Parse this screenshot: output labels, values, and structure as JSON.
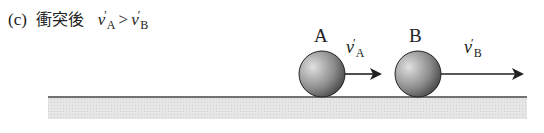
{
  "caption": {
    "label": "(c)",
    "japanese": "衝突後",
    "lhs_var": "v",
    "lhs_prime": "′",
    "lhs_sub": "A",
    "relation": ">",
    "rhs_var": "v",
    "rhs_prime": "′",
    "rhs_sub": "B"
  },
  "balls": [
    {
      "label": "A",
      "velocity_var": "v",
      "velocity_prime": "′",
      "velocity_sub": "A"
    },
    {
      "label": "B",
      "velocity_var": "v",
      "velocity_prime": "′",
      "velocity_sub": "B"
    }
  ],
  "colors": {
    "ground_line": "#444444",
    "ground_fill": "#e2e2e2",
    "ball_dark": "#555555",
    "ball_light": "#d8d8d8"
  }
}
